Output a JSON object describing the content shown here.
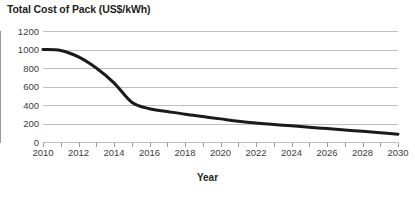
{
  "chart_data": {
    "type": "line",
    "title": "Total Cost of Pack (US$/kWh)",
    "xlabel": "Year",
    "ylabel": "",
    "xlim": [
      2010,
      2030
    ],
    "ylim": [
      0,
      1200
    ],
    "grid": true,
    "legend": false,
    "y_ticks": [
      1200,
      1000,
      800,
      600,
      400,
      200,
      0
    ],
    "x_ticks": [
      2010,
      2011,
      2012,
      2013,
      2014,
      2015,
      2016,
      2017,
      2018,
      2019,
      2020,
      2021,
      2022,
      2023,
      2024,
      2025,
      2026,
      2027,
      2028,
      2029,
      2030
    ],
    "x_tick_labels": [
      2010,
      2012,
      2014,
      2016,
      2018,
      2020,
      2022,
      2024,
      2026,
      2028,
      2030
    ],
    "series": [
      {
        "name": "Total Cost of Pack",
        "x": [
          2010,
          2011,
          2012,
          2013,
          2014,
          2015,
          2016,
          2017,
          2018,
          2019,
          2020,
          2021,
          2022,
          2023,
          2024,
          2025,
          2026,
          2027,
          2028,
          2029,
          2030
        ],
        "values": [
          1000,
          990,
          920,
          800,
          640,
          430,
          360,
          330,
          300,
          275,
          250,
          225,
          205,
          190,
          175,
          160,
          145,
          130,
          115,
          100,
          85
        ],
        "color": "#1a1a1a",
        "line_width": 3
      }
    ]
  },
  "axis": {
    "y_tick_labels": [
      "1200",
      "1000",
      "800",
      "600",
      "400",
      "200",
      "0"
    ],
    "x_tick_labels": [
      "2010",
      "2012",
      "2014",
      "2016",
      "2018",
      "2020",
      "2022",
      "2024",
      "2026",
      "2028",
      "2030"
    ]
  },
  "colors": {
    "curve": "#1a1a1a",
    "gridline": "#bfbfbf",
    "axis": "#9a9a9a",
    "text": "#3c3c3c",
    "title_text": "#231f20",
    "background": "#ffffff"
  }
}
